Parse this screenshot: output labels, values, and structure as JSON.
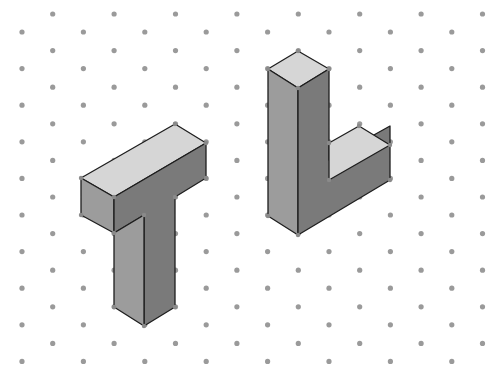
{
  "diagram": {
    "type": "isometric-dot-grid-drawing",
    "background": "#ffffff",
    "grid": {
      "dot_color": "#9a9a9a",
      "dot_radius": 2.6,
      "col_spacing": 30.7,
      "row_spacing": 36.6,
      "x0": 22,
      "y_even_col": 32,
      "y_odd_col": 14,
      "cols": 17,
      "rows": 11
    },
    "colors": {
      "top_face": "#d6d6d6",
      "left_face": "#9c9c9c",
      "right_face": "#7a7a7a",
      "edge": "#1e1e1e"
    },
    "shapes": [
      {
        "name": "T-shape",
        "faces": [
          {
            "role": "top",
            "points": "81,178 175,124 206,143 114,197"
          },
          {
            "role": "bar-left",
            "points": "81,178 114,197 114,233 81,215"
          },
          {
            "role": "bar-front",
            "points": "114,197 206,143 206,178 175,197 175,307 144,326 144,215 114,233"
          },
          {
            "role": "leg-left",
            "points": "114,233 144,215 144,326 114,307"
          }
        ],
        "vertices": [
          [
            175,
            124
          ],
          [
            206,
            143
          ],
          [
            81,
            178
          ],
          [
            114,
            197
          ],
          [
            206,
            178
          ],
          [
            175,
            197
          ],
          [
            81,
            215
          ],
          [
            114,
            233
          ],
          [
            144,
            215
          ],
          [
            114,
            307
          ],
          [
            144,
            326
          ],
          [
            175,
            307
          ]
        ]
      },
      {
        "name": "L-shape",
        "faces": [
          {
            "role": "pillar-top",
            "points": "268,69 298,51 329,69 298,88"
          },
          {
            "role": "pillar-left",
            "points": "268,69 298,88 298,235 268,216"
          },
          {
            "role": "front",
            "points": "298,88 329,69 329,160 390,126 390,180 298,235"
          },
          {
            "role": "foot-top",
            "points": "329,143 359,126 390,145 329,180"
          }
        ],
        "vertices": [
          [
            298,
            51
          ],
          [
            268,
            69
          ],
          [
            329,
            69
          ],
          [
            298,
            88
          ],
          [
            359,
            126
          ],
          [
            390,
            145
          ],
          [
            329,
            143
          ],
          [
            329,
            180
          ],
          [
            390,
            180
          ],
          [
            268,
            216
          ],
          [
            298,
            235
          ]
        ]
      }
    ]
  }
}
